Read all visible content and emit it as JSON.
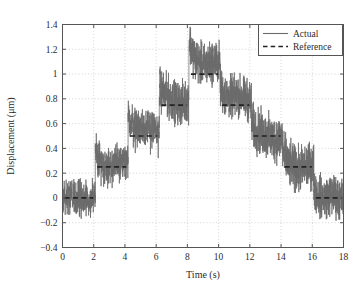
{
  "chart_data": {
    "type": "line",
    "title": "",
    "xlabel": "Time (s)",
    "ylabel": "Displacement (μm)",
    "xlim": [
      0,
      18
    ],
    "ylim": [
      -0.4,
      1.4
    ],
    "xticks": [
      0,
      2,
      4,
      6,
      8,
      10,
      12,
      14,
      16,
      18
    ],
    "xtick_labels": [
      "0",
      "2",
      "4",
      "6",
      "8",
      "10",
      "12",
      "14",
      "16",
      "18"
    ],
    "yticks": [
      -0.4,
      -0.2,
      0,
      0.2,
      0.4,
      0.6,
      0.8,
      1.0,
      1.2,
      1.4
    ],
    "ytick_labels": [
      "−0.4",
      "−0.2",
      "0",
      "0.2",
      "0.4",
      "0.6",
      "0.8",
      "1",
      "1.2",
      "1.4"
    ],
    "grid": true,
    "grid_style": "dotted",
    "grid_color": "#c8c8c8",
    "legend": {
      "position": "top-right",
      "entries": [
        {
          "label": "Actual",
          "style": "solid",
          "color": "#6b6b6b"
        },
        {
          "label": "Reference",
          "style": "dashed",
          "color": "#222222"
        }
      ]
    },
    "series": [
      {
        "name": "Reference",
        "style": "dashed",
        "color": "#222222",
        "description": "Staircase reference command, 0.25 μm steps up then down",
        "steps": [
          {
            "t_start": 0.0,
            "t_end": 2.1,
            "value": 0.0
          },
          {
            "t_start": 2.1,
            "t_end": 4.2,
            "value": 0.25
          },
          {
            "t_start": 4.2,
            "t_end": 6.2,
            "value": 0.5
          },
          {
            "t_start": 6.2,
            "t_end": 8.1,
            "value": 0.75
          },
          {
            "t_start": 8.1,
            "t_end": 10.1,
            "value": 1.0
          },
          {
            "t_start": 10.1,
            "t_end": 12.1,
            "value": 0.75
          },
          {
            "t_start": 12.1,
            "t_end": 14.1,
            "value": 0.5
          },
          {
            "t_start": 14.1,
            "t_end": 16.1,
            "value": 0.25
          },
          {
            "t_start": 16.1,
            "t_end": 18.0,
            "value": 0.0
          }
        ]
      },
      {
        "name": "Actual",
        "style": "solid",
        "color": "#6b6b6b",
        "description": "Measured displacement tracking the reference staircase with broadband noise of roughly ±0.1 μm and transient overshoot at each step edge",
        "noise_amplitude": 0.1,
        "overshoot_peak": 1.27,
        "overshoot_time": 8.3,
        "min_value": -0.23,
        "max_value": 1.27,
        "segments": [
          {
            "t_start": 0.0,
            "t_end": 2.1,
            "mean": 0.0,
            "noise": 0.1,
            "overshoot": 0.0
          },
          {
            "t_start": 2.1,
            "t_end": 4.2,
            "mean": 0.27,
            "noise": 0.11,
            "overshoot": 0.09
          },
          {
            "t_start": 4.2,
            "t_end": 6.2,
            "mean": 0.55,
            "noise": 0.12,
            "overshoot": 0.14
          },
          {
            "t_start": 6.2,
            "t_end": 8.1,
            "mean": 0.78,
            "noise": 0.12,
            "overshoot": 0.12
          },
          {
            "t_start": 8.1,
            "t_end": 10.1,
            "mean": 1.08,
            "noise": 0.12,
            "overshoot": 0.19
          },
          {
            "t_start": 10.1,
            "t_end": 12.1,
            "mean": 0.8,
            "noise": 0.12,
            "overshoot": 0.12
          },
          {
            "t_start": 12.1,
            "t_end": 14.1,
            "mean": 0.49,
            "noise": 0.13,
            "overshoot": 0.12
          },
          {
            "t_start": 14.1,
            "t_end": 16.1,
            "mean": 0.24,
            "noise": 0.13,
            "overshoot": 0.12
          },
          {
            "t_start": 16.1,
            "t_end": 18.0,
            "mean": 0.0,
            "noise": 0.12,
            "overshoot": 0.1
          }
        ]
      }
    ]
  }
}
